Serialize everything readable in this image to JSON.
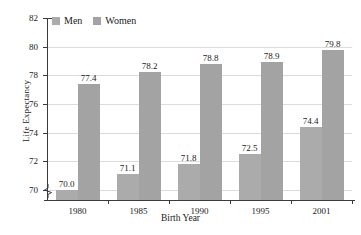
{
  "chart_data": {
    "type": "bar",
    "title": "",
    "xlabel": "Birth Year",
    "ylabel": "Life Expectancy",
    "categories": [
      "1980",
      "1985",
      "1990",
      "1995",
      "2001"
    ],
    "series": [
      {
        "name": "Men",
        "values": [
          70.0,
          71.1,
          71.8,
          72.5,
          74.4
        ],
        "color": "#ababab"
      },
      {
        "name": "Women",
        "values": [
          77.4,
          78.2,
          78.8,
          78.9,
          79.8
        ],
        "color": "#a3a3a3"
      }
    ],
    "value_labels": {
      "Men": [
        "70.0",
        "71.1",
        "71.8",
        "72.5",
        "74.4"
      ],
      "Women": [
        "77.4",
        "78.2",
        "78.8",
        "78.9",
        "79.8"
      ]
    },
    "ylim": [
      69.3,
      82
    ],
    "yticks": [
      70,
      72,
      74,
      76,
      78,
      80,
      82
    ],
    "ytick_labels": [
      "70",
      "72",
      "74",
      "76",
      "78",
      "80",
      "82"
    ],
    "axis_break": true,
    "grid": true,
    "legend_position": "top-left"
  },
  "legend": {
    "items": [
      {
        "label": "Men",
        "swatch_name": "legend-swatch-men"
      },
      {
        "label": "Women",
        "swatch_name": "legend-swatch-women"
      }
    ]
  },
  "axes": {
    "y_title": "Life Expectancy",
    "x_title": "Birth Year"
  }
}
